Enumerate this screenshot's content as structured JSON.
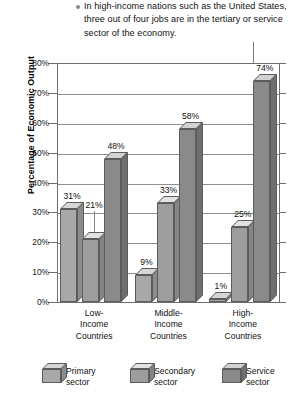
{
  "caption": {
    "bullet_icon": "bullet-dot-icon",
    "text": "In high-income nations such as the United States, three out of four jobs are in the tertiary or service sector of the economy."
  },
  "chart_data": {
    "type": "bar",
    "title": "",
    "xlabel": "",
    "ylabel": "Percentage of Economic Output",
    "ylim": [
      0,
      80
    ],
    "ytick_labels": [
      "0%",
      "10%",
      "20%",
      "30%",
      "40%",
      "50%",
      "60%",
      "70%",
      "80%"
    ],
    "ytick_values": [
      0,
      10,
      20,
      30,
      40,
      50,
      60,
      70,
      80
    ],
    "grid": true,
    "legend_position": "bottom",
    "categories": [
      "Low-Income Countries",
      "Middle-Income Countries",
      "High-Income Countries"
    ],
    "category_lines": [
      [
        "Low-",
        "Income",
        "Countries"
      ],
      [
        "Middle-",
        "Income",
        "Countries"
      ],
      [
        "High-",
        "Income",
        "Countries"
      ]
    ],
    "series": [
      {
        "name": "Primary sector",
        "legend_lines": [
          "Primary",
          "sector"
        ],
        "color": "#a8a8a8",
        "top_color": "#d6d6d6",
        "side_color": "#8c8c8c",
        "values": [
          31,
          9,
          1
        ],
        "labels": [
          "31%",
          "9%",
          "1%"
        ]
      },
      {
        "name": "Secondary sector",
        "legend_lines": [
          "Secondary",
          "sector"
        ],
        "color": "#9d9d9d",
        "top_color": "#e2e2e2",
        "side_color": "#858585",
        "values": [
          21,
          33,
          25
        ],
        "labels": [
          "21%",
          "33%",
          "25%"
        ]
      },
      {
        "name": "Service sector",
        "legend_lines": [
          "Service",
          "sector"
        ],
        "color": "#8a8a8a",
        "top_color": "#d2d2d2",
        "side_color": "#6f6f6f",
        "values": [
          48,
          58,
          74
        ],
        "labels": [
          "48%",
          "58%",
          "74%"
        ]
      }
    ]
  }
}
